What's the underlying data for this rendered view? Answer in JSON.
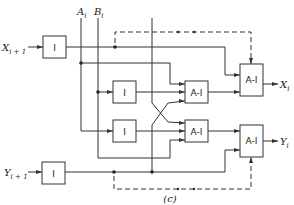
{
  "diagram": {
    "caption": "(c)",
    "inputs": {
      "x_next": "X",
      "x_next_sub": "i + 1",
      "y_next": "Y",
      "y_next_sub": "i + 1",
      "a": "A",
      "a_sub": "i",
      "b": "B",
      "b_sub": "i"
    },
    "outputs": {
      "x": "X",
      "x_sub": "i",
      "y": "Y",
      "y_sub": "i"
    },
    "gates": {
      "inverter": "I",
      "and_invert": "A-I"
    },
    "ellipsis": "• •"
  }
}
